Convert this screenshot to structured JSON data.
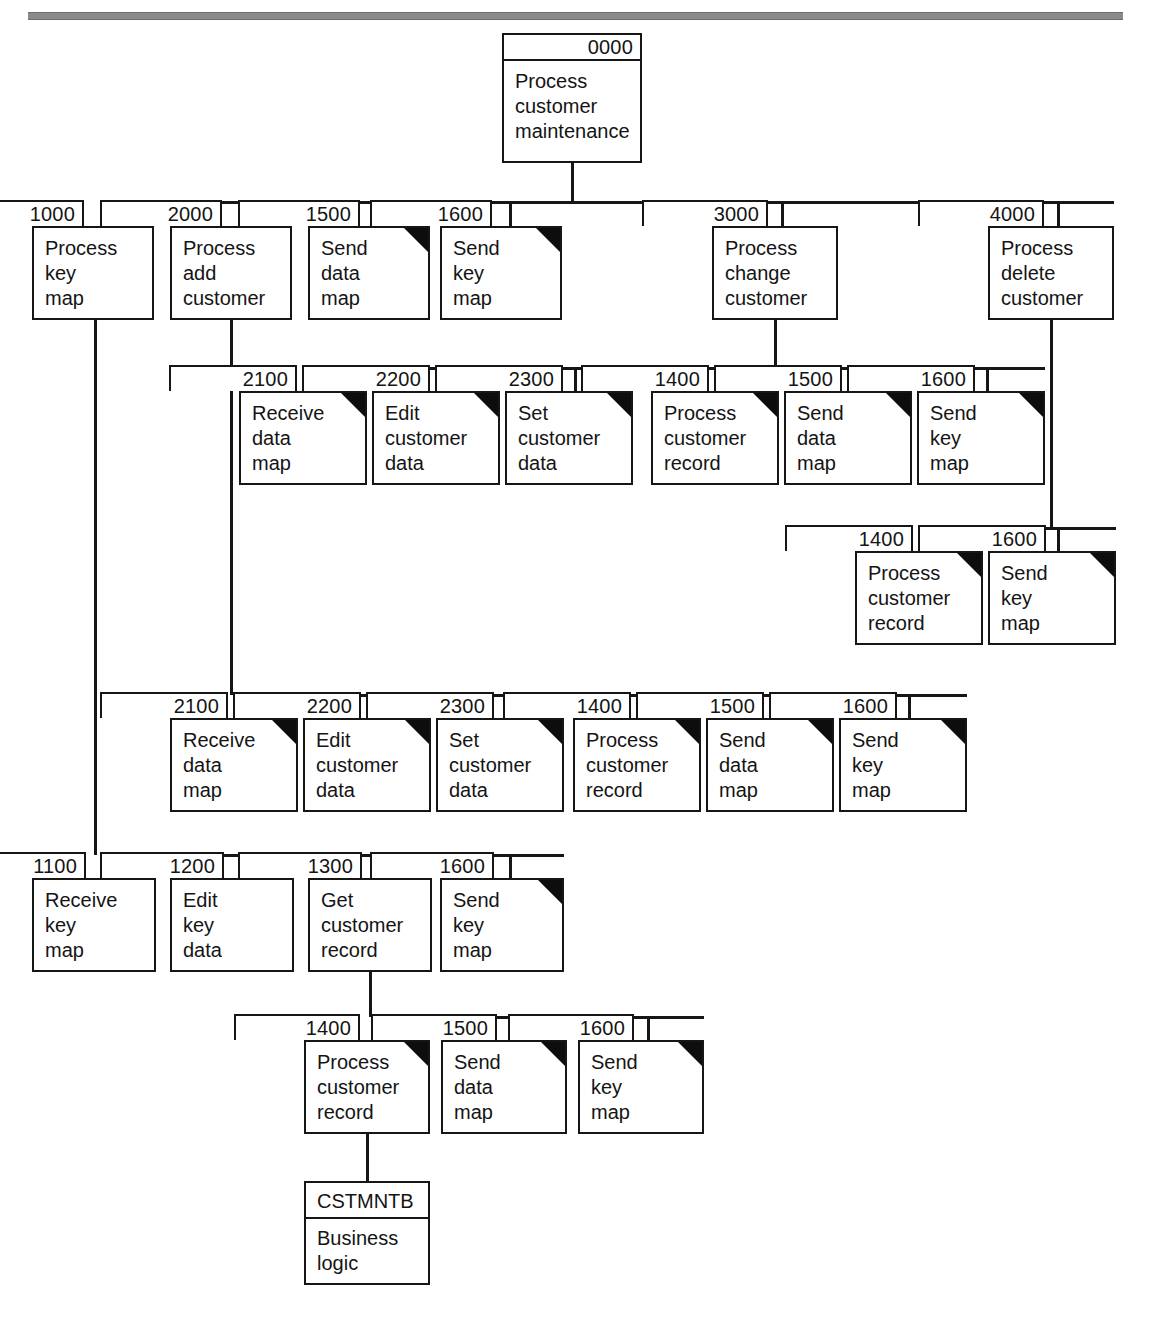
{
  "diagram": {
    "kind": "structure-chart",
    "title_rule": "horizontal-rule",
    "nodes": [
      {
        "id": "n0000",
        "number": "0000",
        "lines": [
          "Process",
          "customer",
          "maintenance"
        ],
        "common": false,
        "x": 502,
        "y": 59,
        "w": 140,
        "h": 104,
        "tab_w": 140,
        "tab_x": 0
      },
      {
        "id": "n1000",
        "number": "1000",
        "lines": [
          "Process",
          "key",
          "map"
        ],
        "common": false,
        "x": 32,
        "y": 226,
        "w": 122,
        "h": 94,
        "tab_w": 122,
        "tab_x": 70
      },
      {
        "id": "n2000",
        "number": "2000",
        "lines": [
          "Process",
          "add",
          "customer"
        ],
        "common": false,
        "x": 170,
        "y": 226,
        "w": 122,
        "h": 94,
        "tab_w": 122,
        "tab_x": 70
      },
      {
        "id": "n1500a",
        "number": "1500",
        "lines": [
          "Send",
          "data",
          "map"
        ],
        "common": true,
        "x": 308,
        "y": 226,
        "w": 122,
        "h": 94,
        "tab_w": 122,
        "tab_x": 70
      },
      {
        "id": "n1600a",
        "number": "1600",
        "lines": [
          "Send",
          "key",
          "map"
        ],
        "common": true,
        "x": 440,
        "y": 226,
        "w": 122,
        "h": 94,
        "tab_w": 122,
        "tab_x": 70
      },
      {
        "id": "n3000",
        "number": "3000",
        "lines": [
          "Process",
          "change",
          "customer"
        ],
        "common": false,
        "x": 712,
        "y": 226,
        "w": 126,
        "h": 94,
        "tab_w": 126,
        "tab_x": 70
      },
      {
        "id": "n4000",
        "number": "4000",
        "lines": [
          "Process",
          "delete",
          "customer"
        ],
        "common": false,
        "x": 988,
        "y": 226,
        "w": 126,
        "h": 94,
        "tab_w": 126,
        "tab_x": 70
      },
      {
        "id": "n2100c",
        "number": "2100",
        "lines": [
          "Receive",
          "data",
          "map"
        ],
        "common": true,
        "x": 239,
        "y": 391,
        "w": 128,
        "h": 94,
        "tab_w": 128,
        "tab_x": 70
      },
      {
        "id": "n2200c",
        "number": "2200",
        "lines": [
          "Edit",
          "customer",
          "data"
        ],
        "common": true,
        "x": 372,
        "y": 391,
        "w": 128,
        "h": 94,
        "tab_w": 128,
        "tab_x": 70
      },
      {
        "id": "n2300c",
        "number": "2300",
        "lines": [
          "Set",
          "customer",
          "data"
        ],
        "common": true,
        "x": 505,
        "y": 391,
        "w": 128,
        "h": 94,
        "tab_w": 128,
        "tab_x": 70
      },
      {
        "id": "n1400c",
        "number": "1400",
        "lines": [
          "Process",
          "customer",
          "record"
        ],
        "common": true,
        "x": 651,
        "y": 391,
        "w": 128,
        "h": 94,
        "tab_w": 128,
        "tab_x": 70
      },
      {
        "id": "n1500c",
        "number": "1500",
        "lines": [
          "Send",
          "data",
          "map"
        ],
        "common": true,
        "x": 784,
        "y": 391,
        "w": 128,
        "h": 94,
        "tab_w": 128,
        "tab_x": 70
      },
      {
        "id": "n1600c",
        "number": "1600",
        "lines": [
          "Send",
          "key",
          "map"
        ],
        "common": true,
        "x": 917,
        "y": 391,
        "w": 128,
        "h": 94,
        "tab_w": 128,
        "tab_x": 70
      },
      {
        "id": "n1400d",
        "number": "1400",
        "lines": [
          "Process",
          "customer",
          "record"
        ],
        "common": true,
        "x": 855,
        "y": 551,
        "w": 128,
        "h": 94,
        "tab_w": 128,
        "tab_x": 70
      },
      {
        "id": "n1600d",
        "number": "1600",
        "lines": [
          "Send",
          "key",
          "map"
        ],
        "common": true,
        "x": 988,
        "y": 551,
        "w": 128,
        "h": 94,
        "tab_w": 128,
        "tab_x": 70
      },
      {
        "id": "n2100a",
        "number": "2100",
        "lines": [
          "Receive",
          "data",
          "map"
        ],
        "common": true,
        "x": 170,
        "y": 718,
        "w": 128,
        "h": 94,
        "tab_w": 128,
        "tab_x": 70
      },
      {
        "id": "n2200a",
        "number": "2200",
        "lines": [
          "Edit",
          "customer",
          "data"
        ],
        "common": true,
        "x": 303,
        "y": 718,
        "w": 128,
        "h": 94,
        "tab_w": 128,
        "tab_x": 70
      },
      {
        "id": "n2300a",
        "number": "2300",
        "lines": [
          "Set",
          "customer",
          "data"
        ],
        "common": true,
        "x": 436,
        "y": 718,
        "w": 128,
        "h": 94,
        "tab_w": 128,
        "tab_x": 70
      },
      {
        "id": "n1400a",
        "number": "1400",
        "lines": [
          "Process",
          "customer",
          "record"
        ],
        "common": true,
        "x": 573,
        "y": 718,
        "w": 128,
        "h": 94,
        "tab_w": 128,
        "tab_x": 70
      },
      {
        "id": "n1500b",
        "number": "1500",
        "lines": [
          "Send",
          "data",
          "map"
        ],
        "common": true,
        "x": 706,
        "y": 718,
        "w": 128,
        "h": 94,
        "tab_w": 128,
        "tab_x": 70
      },
      {
        "id": "n1600b",
        "number": "1600",
        "lines": [
          "Send",
          "key",
          "map"
        ],
        "common": true,
        "x": 839,
        "y": 718,
        "w": 128,
        "h": 94,
        "tab_w": 128,
        "tab_x": 70
      },
      {
        "id": "n1100",
        "number": "1100",
        "lines": [
          "Receive",
          "key",
          "map"
        ],
        "common": false,
        "x": 32,
        "y": 878,
        "w": 124,
        "h": 94,
        "tab_w": 124,
        "tab_x": 70
      },
      {
        "id": "n1200",
        "number": "1200",
        "lines": [
          "Edit",
          "key",
          "data"
        ],
        "common": false,
        "x": 170,
        "y": 878,
        "w": 124,
        "h": 94,
        "tab_w": 124,
        "tab_x": 70
      },
      {
        "id": "n1300",
        "number": "1300",
        "lines": [
          "Get",
          "customer",
          "record"
        ],
        "common": false,
        "x": 308,
        "y": 878,
        "w": 124,
        "h": 94,
        "tab_w": 124,
        "tab_x": 70
      },
      {
        "id": "n1600e",
        "number": "1600",
        "lines": [
          "Send",
          "key",
          "map"
        ],
        "common": true,
        "x": 440,
        "y": 878,
        "w": 124,
        "h": 94,
        "tab_w": 124,
        "tab_x": 70
      },
      {
        "id": "n1400g",
        "number": "1400",
        "lines": [
          "Process",
          "customer",
          "record"
        ],
        "common": true,
        "x": 304,
        "y": 1040,
        "w": 126,
        "h": 94,
        "tab_w": 126,
        "tab_x": 70
      },
      {
        "id": "n1500g",
        "number": "1500",
        "lines": [
          "Send",
          "data",
          "map"
        ],
        "common": true,
        "x": 441,
        "y": 1040,
        "w": 126,
        "h": 94,
        "tab_w": 126,
        "tab_x": 70
      },
      {
        "id": "n1600g",
        "number": "1600",
        "lines": [
          "Send",
          "key",
          "map"
        ],
        "common": true,
        "x": 578,
        "y": 1040,
        "w": 126,
        "h": 94,
        "tab_w": 126,
        "tab_x": 70
      }
    ],
    "store_node": {
      "id": "cstmntb",
      "name": "CSTMNTB",
      "lines": [
        "Business",
        "logic"
      ],
      "x": 304,
      "y": 1181,
      "w": 126,
      "h": 104
    }
  }
}
